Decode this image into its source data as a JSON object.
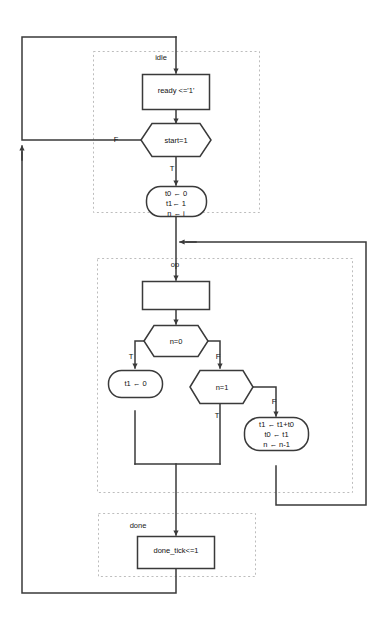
{
  "diagram": {
    "type": "asm-flowchart",
    "colors": {
      "background": "#ffffff",
      "line": "#3a3a3a",
      "dashed_box": "#bdbdbd",
      "text": "#111111"
    }
  },
  "states": [
    {
      "id": "idle",
      "name": "idle"
    },
    {
      "id": "op",
      "name": "op"
    },
    {
      "id": "done",
      "name": "done"
    }
  ],
  "blocks": {
    "ready": {
      "kind": "state-box",
      "text": "ready <='1'"
    },
    "op_empty": {
      "kind": "state-box",
      "text": ""
    },
    "done_tick": {
      "kind": "state-box",
      "text": "done_tick<=1"
    },
    "init": {
      "kind": "conditional-output",
      "lines": [
        "t0 ← 0",
        "t1← 1",
        "n ← i"
      ]
    },
    "clear_t1": {
      "kind": "conditional-output",
      "lines": [
        "t1 ← 0"
      ]
    },
    "update": {
      "kind": "conditional-output",
      "lines": [
        "t1 ← t1+t0",
        "t0 ← t1",
        "n ← n-1"
      ]
    }
  },
  "decisions": [
    {
      "id": "start",
      "text": "start=1",
      "true_label": "T",
      "false_label": "F"
    },
    {
      "id": "n_eq_0",
      "text": "n=0",
      "true_label": "T",
      "false_label": "F"
    },
    {
      "id": "n_eq_1",
      "text": "n=1",
      "true_label": "T",
      "false_label": "F"
    }
  ],
  "edge_labels": {
    "start_false": "F",
    "start_true": "T",
    "n0_true": "T",
    "n0_false": "F",
    "n1_true": "T",
    "n1_false": "F"
  }
}
